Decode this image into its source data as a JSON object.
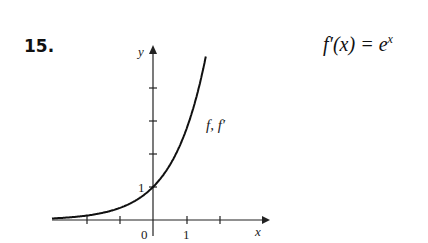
{
  "problem_number": "15.",
  "equation": {
    "lhs": "f′(x) = e",
    "exponent": "x"
  },
  "chart_data": {
    "type": "line",
    "title": "",
    "xlabel": "x",
    "ylabel": "y",
    "series": [
      {
        "name": "f, f′",
        "function": "e^x",
        "x": [
          -3,
          -2,
          -1,
          0,
          0.5,
          1,
          1.6
        ],
        "values": [
          0.05,
          0.14,
          0.37,
          1,
          1.65,
          2.72,
          4.95
        ]
      }
    ],
    "x_tick_labels": [
      "0",
      "1"
    ],
    "y_tick_labels": [
      "1"
    ],
    "xlim": [
      -3.1,
      2.5
    ],
    "ylim": [
      0,
      5.1
    ],
    "grid": false,
    "annotation": "f, f′"
  },
  "labels": {
    "x": "x",
    "y": "y",
    "zero": "0",
    "one_x": "1",
    "one_y": "1",
    "curve": "f, f′"
  }
}
